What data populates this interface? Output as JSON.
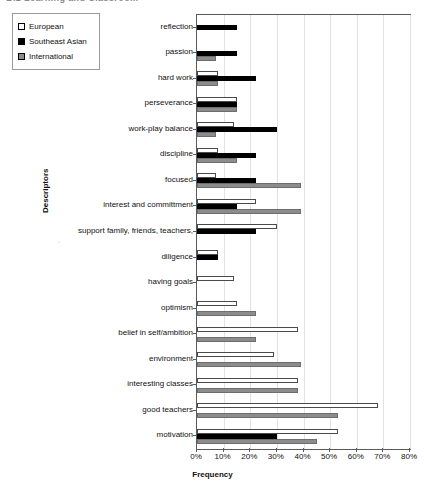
{
  "header": {
    "clipped_text": "B.2   Learning and Classroom"
  },
  "legend": {
    "position": "top-left",
    "items": [
      {
        "label": "European",
        "icon": "square-outline-swatch",
        "color": "#ffffff"
      },
      {
        "label": "Southeast Asian",
        "icon": "square-filled-swatch",
        "color": "#000000"
      },
      {
        "label": "International",
        "icon": "square-gray-swatch",
        "color": "#8c8c8c"
      }
    ]
  },
  "chart_data": {
    "type": "bar",
    "orientation": "horizontal",
    "title": "",
    "xlabel": "Frequency",
    "ylabel": "Descriptors",
    "xlim": [
      0,
      80
    ],
    "xticks": [
      0,
      10,
      20,
      30,
      40,
      50,
      60,
      70,
      80
    ],
    "xticklabels": [
      "0%",
      "10%",
      "20%",
      "30%",
      "40%",
      "50%",
      "60%",
      "70%",
      "80%"
    ],
    "grid": true,
    "grid_axis": "x",
    "legend_position": "upper left",
    "categories": [
      "reflection",
      "passion",
      "hard work",
      "perseverance",
      "work-play balance",
      "discipline",
      "focused",
      "interest and committment",
      "support family, friends, teachers,",
      "diligence",
      "having goals",
      "optimism",
      "belief in self/ambition",
      "environment",
      "interesting classes",
      "good teachers",
      "motivation"
    ],
    "series": [
      {
        "name": "European",
        "color": "#ffffff",
        "values": [
          0,
          0,
          8,
          15,
          14,
          8,
          7,
          22,
          30,
          8,
          14,
          15,
          38,
          29,
          38,
          68,
          53
        ]
      },
      {
        "name": "Southeast Asian",
        "color": "#000000",
        "values": [
          15,
          15,
          22,
          15,
          30,
          22,
          22,
          15,
          22,
          8,
          0,
          0,
          0,
          0,
          0,
          0,
          30
        ]
      },
      {
        "name": "International",
        "color": "#8c8c8c",
        "values": [
          0,
          7,
          8,
          15,
          7,
          15,
          39,
          39,
          0,
          0,
          0,
          22,
          22,
          39,
          38,
          53,
          45
        ]
      }
    ]
  }
}
